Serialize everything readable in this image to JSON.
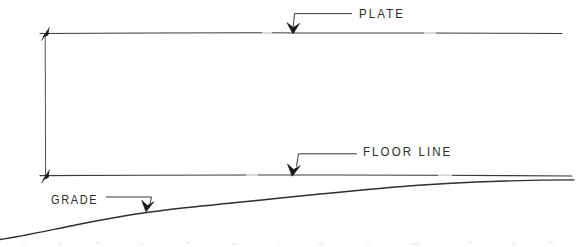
{
  "drawing": {
    "type": "architectural-elevation-section-detail",
    "background_color": "#ffffff",
    "ink_color": "#333333",
    "width": 584,
    "height": 247,
    "annotations": {
      "plate_label": "PLATE",
      "floor_line_label": "FLOOR LINE",
      "grade_label": "GRADE"
    },
    "elements": {
      "plate_line": {
        "name": "plate-line",
        "description": "horizontal reference line at top of wall",
        "x_start": 40,
        "x_end": 562,
        "y": 33
      },
      "floor_line": {
        "name": "floor-line",
        "description": "horizontal reference line at floor level",
        "x_start": 40,
        "x_end": 572,
        "y": 175
      },
      "grade_line": {
        "name": "grade-line",
        "description": "sloping ground grade profile rising left to right",
        "x_start": 0,
        "x_end": 574,
        "y_start": 239,
        "y_end": 180
      },
      "dimension_line": {
        "name": "wall-height-dimension",
        "description": "vertical dimension line from floor line to plate line",
        "x": 45,
        "y_top": 33,
        "y_bottom": 176
      }
    },
    "leaders": {
      "plate": {
        "name": "plate-leader",
        "text_anchor_x": 352,
        "elbow_x": 293,
        "elbow_y": 14,
        "arrow_x": 293,
        "arrow_y": 33
      },
      "floor_line": {
        "name": "floor-line-leader",
        "text_anchor_x": 357,
        "elbow_x": 297,
        "elbow_y": 154,
        "arrow_x": 292,
        "arrow_y": 175
      },
      "grade": {
        "name": "grade-leader",
        "text_anchor_x": 106,
        "elbow_x": 150,
        "elbow_y": 197,
        "arrow_x": 146,
        "arrow_y": 211
      }
    }
  }
}
